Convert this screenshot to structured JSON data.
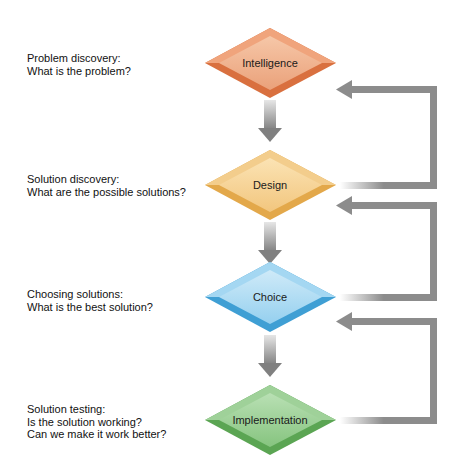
{
  "stages": [
    {
      "name": "Intelligence",
      "color": "#e8875a",
      "question": [
        "Problem discovery:",
        "What is the problem?"
      ]
    },
    {
      "name": "Design",
      "color": "#f0c070",
      "question": [
        "Solution discovery:",
        "What are the possible solutions?"
      ]
    },
    {
      "name": "Choice",
      "color": "#7cc4e8",
      "question": [
        "Choosing solutions:",
        "What is the best solution?"
      ]
    },
    {
      "name": "Implementation",
      "color": "#7cc47c",
      "question": [
        "Solution testing:",
        "Is the solution working?",
        "Can we make it work better?"
      ]
    }
  ],
  "arrow_color": "#8a8a8a"
}
